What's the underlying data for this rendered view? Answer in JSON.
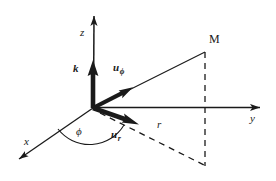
{
  "figure": {
    "kind": "3d-cylindrical-coordinate-axes-diagram",
    "background_color": "#ffffff",
    "stroke_color": "#1a1a1a",
    "width": 276,
    "height": 181
  },
  "geometry": {
    "origin": {
      "x": 93,
      "y": 108
    },
    "z_axis_tip": {
      "x": 94,
      "y": 9
    },
    "y_axis_tip": {
      "x": 268,
      "y": 107
    },
    "x_axis_tip": {
      "x": 12,
      "y": 164
    },
    "point_M": {
      "x": 205,
      "y": 52
    },
    "foot_point": {
      "x": 205,
      "y": 165
    },
    "y_axis_crossing": {
      "x": 205,
      "y": 107
    }
  },
  "axes": [
    {
      "name": "z-axis",
      "label": "z",
      "label_x": 80,
      "label_y": 27,
      "direction": "up"
    },
    {
      "name": "y-axis",
      "label": "y",
      "label_x": 250,
      "label_y": 114,
      "direction": "right"
    },
    {
      "name": "x-axis",
      "label": "x",
      "label_x": 24,
      "label_y": 137,
      "direction": "down-left"
    }
  ],
  "points": [
    {
      "name": "point-M",
      "label": "M",
      "label_x": 209,
      "label_y": 34
    }
  ],
  "vectors": [
    {
      "name": "unit-vector-k",
      "base_label": "k",
      "subscript": "",
      "label_x": 74,
      "label_y": 64,
      "tip": {
        "x": 93,
        "y": 62
      },
      "direction": "vertical-up"
    },
    {
      "name": "unit-vector-u-phi",
      "base_label": "u",
      "subscript": "ϕ",
      "label_x": 114,
      "label_y": 63,
      "tip": {
        "x": 130,
        "y": 87
      },
      "direction": "up-right-toward-M"
    },
    {
      "name": "unit-vector-u-r",
      "base_label": "u",
      "subscript": "r",
      "label_x": 112,
      "label_y": 130,
      "tip": {
        "x": 137,
        "y": 127
      },
      "direction": "down-right"
    }
  ],
  "annotations": [
    {
      "name": "angle-phi",
      "label": "ϕ",
      "label_x": 77,
      "label_y": 127
    },
    {
      "name": "radius-r",
      "label": "r",
      "label_x": 157,
      "label_y": 120
    }
  ],
  "dashed_segments": [
    {
      "name": "vertical-drop-from-M",
      "from": {
        "x": 205,
        "y": 52
      },
      "to": {
        "x": 205,
        "y": 165
      }
    },
    {
      "name": "radial-projection-line",
      "from": {
        "x": 98,
        "y": 113
      },
      "to": {
        "x": 205,
        "y": 165
      }
    }
  ],
  "solid_segments": [
    {
      "name": "origin-to-M-line",
      "from": {
        "x": 93,
        "y": 108
      },
      "to": {
        "x": 205,
        "y": 52
      }
    }
  ]
}
